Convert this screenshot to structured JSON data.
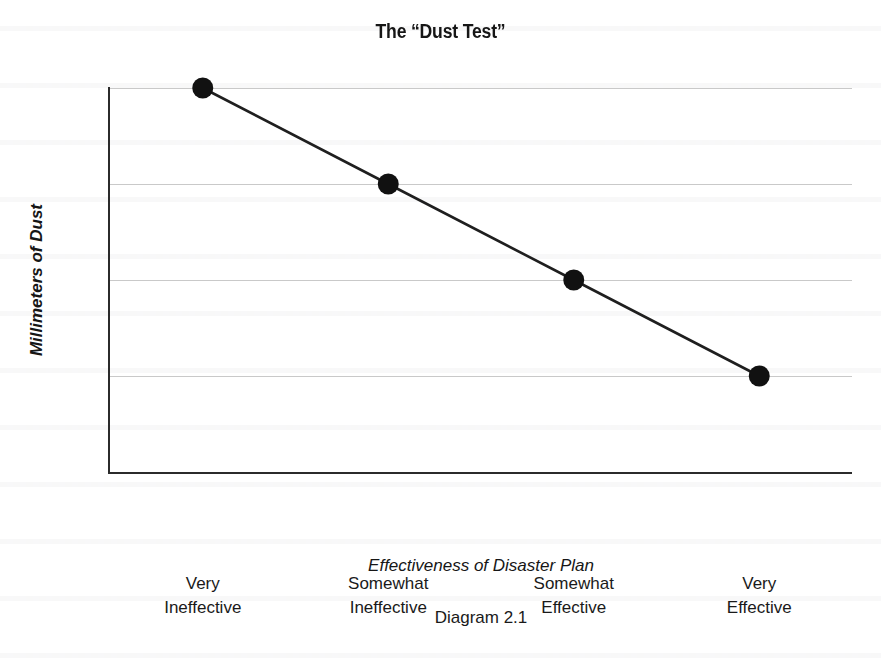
{
  "figure": {
    "caption": "Diagram 2.1"
  },
  "chart_data": {
    "type": "line",
    "title": "The “Dust Test”",
    "xlabel": "Effectiveness of Disaster Plan",
    "ylabel": "Millimeters of Dust",
    "categories": [
      "Very Ineffective",
      "Somewhat Ineffective",
      "Somewhat Effective",
      "Very Effective"
    ],
    "category_lines": [
      [
        "Very",
        "Ineffective"
      ],
      [
        "Somewhat",
        "Ineffective"
      ],
      [
        "Somewhat",
        "Effective"
      ],
      [
        "Very",
        "Effective"
      ]
    ],
    "values": [
      4,
      3,
      2,
      1
    ],
    "ylim": [
      0,
      4
    ],
    "yticks": [
      0,
      1,
      2,
      3,
      4
    ],
    "ytick_labels": [
      "0",
      "1",
      "2",
      "3",
      "4"
    ],
    "grid": "horizontal",
    "legend": "none",
    "marker": "filled-circle",
    "marker_color": "#111111",
    "line_color": "#1f1f1f",
    "gridline_color": "#c9c9c9",
    "axis_color": "#2b2b2b",
    "background_color": "#ffffff"
  }
}
